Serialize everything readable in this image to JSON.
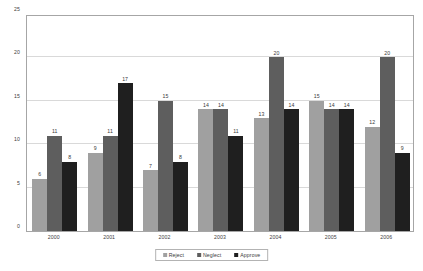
{
  "chart_data": {
    "type": "bar",
    "title": "",
    "subtitle": "",
    "xlabel": "",
    "ylabel": "",
    "categories": [
      "2000",
      "2001",
      "2002",
      "2003",
      "2004",
      "2005",
      "2006"
    ],
    "series": [
      {
        "name": "Reject",
        "color": "#a0a0a0",
        "values": [
          6,
          9,
          7,
          14,
          13,
          15,
          12
        ]
      },
      {
        "name": "Neglect",
        "color": "#5e5e5e",
        "values": [
          11,
          11,
          15,
          14,
          20,
          14,
          20
        ]
      },
      {
        "name": "Approve",
        "color": "#1f1f1f",
        "values": [
          8,
          17,
          8,
          11,
          14,
          14,
          9
        ]
      }
    ],
    "ylim": [
      0,
      25
    ],
    "yticks": [
      0,
      5,
      10,
      15,
      20,
      25
    ],
    "ytick_labels": [
      "0",
      "5",
      "10",
      "15",
      "20",
      "25"
    ],
    "grid": true,
    "grid_color": "#d9d9d9",
    "legend_position": "bottom",
    "data_labels": true,
    "plot_border_color": "#a6a6a6",
    "background_color": "#ffffff",
    "text_color": "#3a3a3a"
  }
}
